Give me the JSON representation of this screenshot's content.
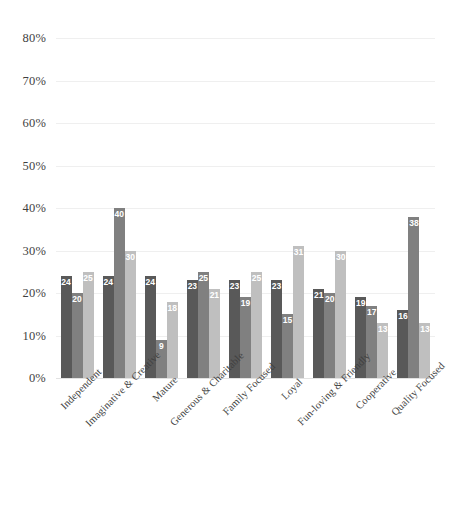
{
  "chart_data": {
    "type": "bar",
    "title": "",
    "subtitle": "",
    "xlabel": "",
    "ylabel": "",
    "ylim": [
      0,
      80
    ],
    "y_ticks": [
      "0%",
      "10%",
      "20%",
      "30%",
      "40%",
      "50%",
      "60%",
      "70%",
      "80%"
    ],
    "y_tick_values": [
      0,
      10,
      20,
      30,
      40,
      50,
      60,
      70,
      80
    ],
    "grid": true,
    "legend": false,
    "legend_position": "none",
    "data_labels": true,
    "categories": [
      "Independent",
      "Imaginative & Creative",
      "Mature",
      "Generous & Charitable",
      "Family Focused",
      "Loyal",
      "Fun-loving & Friendly",
      "Cooperative",
      "Quality Focused"
    ],
    "series": [
      {
        "name": "Series 1",
        "color": "#595959",
        "values": [
          24,
          24,
          24,
          23,
          23,
          23,
          21,
          19,
          16
        ]
      },
      {
        "name": "Series 2",
        "color": "#808080",
        "values": [
          20,
          40,
          9,
          25,
          19,
          15,
          20,
          17,
          38
        ]
      },
      {
        "name": "Series 3",
        "color": "#bfbfbf",
        "values": [
          25,
          30,
          18,
          21,
          25,
          31,
          30,
          13,
          13
        ]
      }
    ]
  },
  "colors": {
    "series_1": "#595959",
    "series_2": "#808080",
    "series_3": "#bfbfbf",
    "gridline": "#efefef",
    "axis_text": "#3f3f3f",
    "data_label": "#ffffff",
    "background": "#ffffff"
  }
}
